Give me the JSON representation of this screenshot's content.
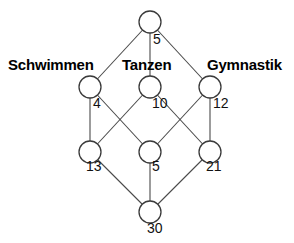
{
  "diagram": {
    "type": "lattice-network",
    "background_color": "#ffffff",
    "node_stroke_color": "#3a3a3a",
    "edge_stroke_color": "#4a4a4a",
    "node_radius": 11,
    "group_labels": [
      {
        "id": "label-schwimmen",
        "text": "Schwimmen",
        "x": 8,
        "y": 57
      },
      {
        "id": "label-tanzen",
        "text": "Tanzen",
        "x": 122,
        "y": 57
      },
      {
        "id": "label-gymnastik",
        "text": "Gymnastik",
        "x": 207,
        "y": 57
      }
    ],
    "nodes": [
      {
        "id": "node-top",
        "value": "5",
        "cx": 150,
        "cy": 22,
        "label_x": 153,
        "label_y": 32
      },
      {
        "id": "node-schwimmen",
        "value": "4",
        "cx": 90,
        "cy": 87,
        "label_x": 93,
        "label_y": 96
      },
      {
        "id": "node-tanzen",
        "value": "10",
        "cx": 150,
        "cy": 87,
        "label_x": 152,
        "label_y": 96
      },
      {
        "id": "node-gymnastik",
        "value": "12",
        "cx": 210,
        "cy": 87,
        "label_x": 213,
        "label_y": 96
      },
      {
        "id": "node-lower-left",
        "value": "13",
        "cx": 90,
        "cy": 152,
        "label_x": 86,
        "label_y": 159
      },
      {
        "id": "node-lower-middle",
        "value": "5",
        "cx": 150,
        "cy": 152,
        "label_x": 152,
        "label_y": 159
      },
      {
        "id": "node-lower-right",
        "value": "21",
        "cx": 210,
        "cy": 152,
        "label_x": 206,
        "label_y": 159
      },
      {
        "id": "node-bottom",
        "value": "30",
        "cx": 150,
        "cy": 212,
        "label_x": 147,
        "label_y": 221
      }
    ],
    "edges": [
      {
        "id": "edge-top-schwimmen",
        "x1": 150,
        "y1": 22,
        "x2": 90,
        "y2": 87
      },
      {
        "id": "edge-top-tanzen",
        "x1": 150,
        "y1": 22,
        "x2": 150,
        "y2": 87
      },
      {
        "id": "edge-top-gymnastik",
        "x1": 150,
        "y1": 22,
        "x2": 210,
        "y2": 87
      },
      {
        "id": "edge-schwimmen-lowerleft",
        "x1": 90,
        "y1": 87,
        "x2": 90,
        "y2": 152
      },
      {
        "id": "edge-schwimmen-lowermiddle",
        "x1": 90,
        "y1": 87,
        "x2": 150,
        "y2": 152
      },
      {
        "id": "edge-tanzen-lowerleft",
        "x1": 150,
        "y1": 87,
        "x2": 90,
        "y2": 152
      },
      {
        "id": "edge-tanzen-lowerright",
        "x1": 150,
        "y1": 87,
        "x2": 210,
        "y2": 152
      },
      {
        "id": "edge-gymnastik-lowermiddle",
        "x1": 210,
        "y1": 87,
        "x2": 150,
        "y2": 152
      },
      {
        "id": "edge-gymnastik-lowerright",
        "x1": 210,
        "y1": 87,
        "x2": 210,
        "y2": 152
      },
      {
        "id": "edge-lowerleft-bottom",
        "x1": 90,
        "y1": 152,
        "x2": 150,
        "y2": 212
      },
      {
        "id": "edge-lowermiddle-bottom",
        "x1": 150,
        "y1": 152,
        "x2": 150,
        "y2": 212
      },
      {
        "id": "edge-lowerright-bottom",
        "x1": 210,
        "y1": 152,
        "x2": 150,
        "y2": 212
      }
    ]
  },
  "chart_data": {
    "type": "diagram",
    "title": "",
    "categories": [
      "Schwimmen",
      "Tanzen",
      "Gymnastik"
    ],
    "node_values": {
      "top": 5,
      "schwimmen": 4,
      "tanzen": 10,
      "gymnastik": 12,
      "lower_left": 13,
      "lower_middle": 5,
      "lower_right": 21,
      "bottom": 30
    }
  }
}
